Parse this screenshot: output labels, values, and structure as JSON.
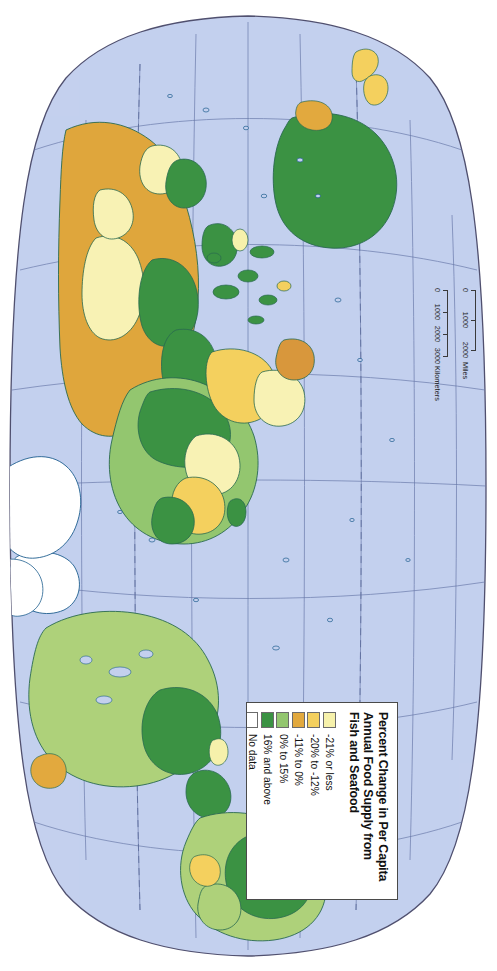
{
  "map": {
    "projection": "Robinson",
    "orientation": "rotated-90-clockwise",
    "ocean_color": "#c4d0ee",
    "graticule_color": "#6878a8",
    "border_color": "#4a4a6a",
    "coastline_color": "#1f5f8f",
    "background": "#ffffff"
  },
  "legend": {
    "title": "Percent Change in Per Capita\nAnnual Food Supply from\nFish and Seafood",
    "title_lines": [
      "Percent Change in Per Capita",
      "Annual Food Supply from",
      "Fish and Seafood"
    ],
    "entries": [
      {
        "label": "-21% or less",
        "color": "#f6f1ab"
      },
      {
        "label": "-20% to -12%",
        "color": "#f4d05e"
      },
      {
        "label": "-11% to 0%",
        "color": "#e2a93e"
      },
      {
        "label": "0% to 15%",
        "color": "#93c66f"
      },
      {
        "label": "16% and above",
        "color": "#3b9243"
      },
      {
        "label": "No data",
        "color": "#ffffff"
      }
    ]
  },
  "scale_bars": [
    {
      "unit": "Miles",
      "ticks": [
        "0",
        "1000",
        "2000"
      ],
      "values": [
        0,
        1000,
        2000
      ]
    },
    {
      "unit": "Kilometers",
      "ticks": [
        "0",
        "1000",
        "2000",
        "3000"
      ],
      "values": [
        0,
        1000,
        2000,
        3000
      ]
    }
  ],
  "regions": {
    "no_data": [
      "Greenland",
      "Antarctica"
    ],
    "notes": "Choropleth world map of percent change in per capita annual food supply from fish and seafood"
  }
}
